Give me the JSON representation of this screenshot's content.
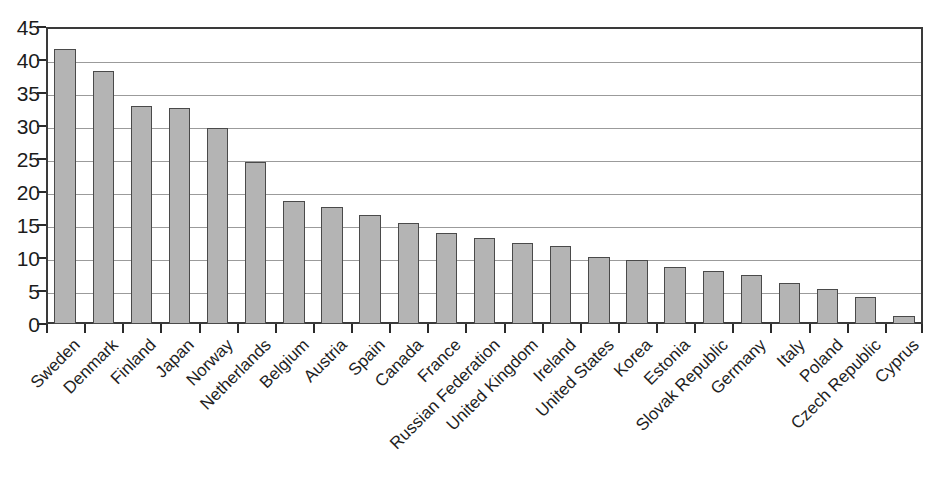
{
  "chart_data": {
    "type": "bar",
    "title": "",
    "subtitle": "",
    "xlabel": "",
    "ylabel": "",
    "ylim": [
      0,
      45
    ],
    "ytick_values": [
      0,
      5,
      10,
      15,
      20,
      25,
      30,
      35,
      40,
      45
    ],
    "ytick_labels": [
      "0",
      "5",
      "10",
      "15",
      "20",
      "25",
      "30",
      "35",
      "40",
      "45"
    ],
    "grid": true,
    "legend": null,
    "legend_position": "none",
    "bar_fill_color": "#b4b4b4",
    "bar_border_color": "#4a4a4a",
    "gridline_color": "#9b9b9b",
    "axis_color": "#3a3a3a",
    "categories": [
      "Sweden",
      "Denmark",
      "Finland",
      "Japan",
      "Norway",
      "Netherlands",
      "Belgium",
      "Austria",
      "Spain",
      "Canada",
      "France",
      "Russian Federation",
      "United Kingdom",
      "Ireland",
      "United States",
      "Korea",
      "Estonia",
      "Slovak Republic",
      "Germany",
      "Italy",
      "Poland",
      "Czech Republic",
      "Cyprus"
    ],
    "values": [
      41.7,
      38.4,
      33.0,
      32.8,
      29.7,
      24.6,
      18.6,
      17.8,
      16.5,
      15.3,
      13.8,
      13.1,
      12.3,
      11.8,
      10.1,
      9.7,
      8.7,
      8.0,
      7.5,
      6.2,
      5.3,
      4.1,
      1.2
    ]
  }
}
